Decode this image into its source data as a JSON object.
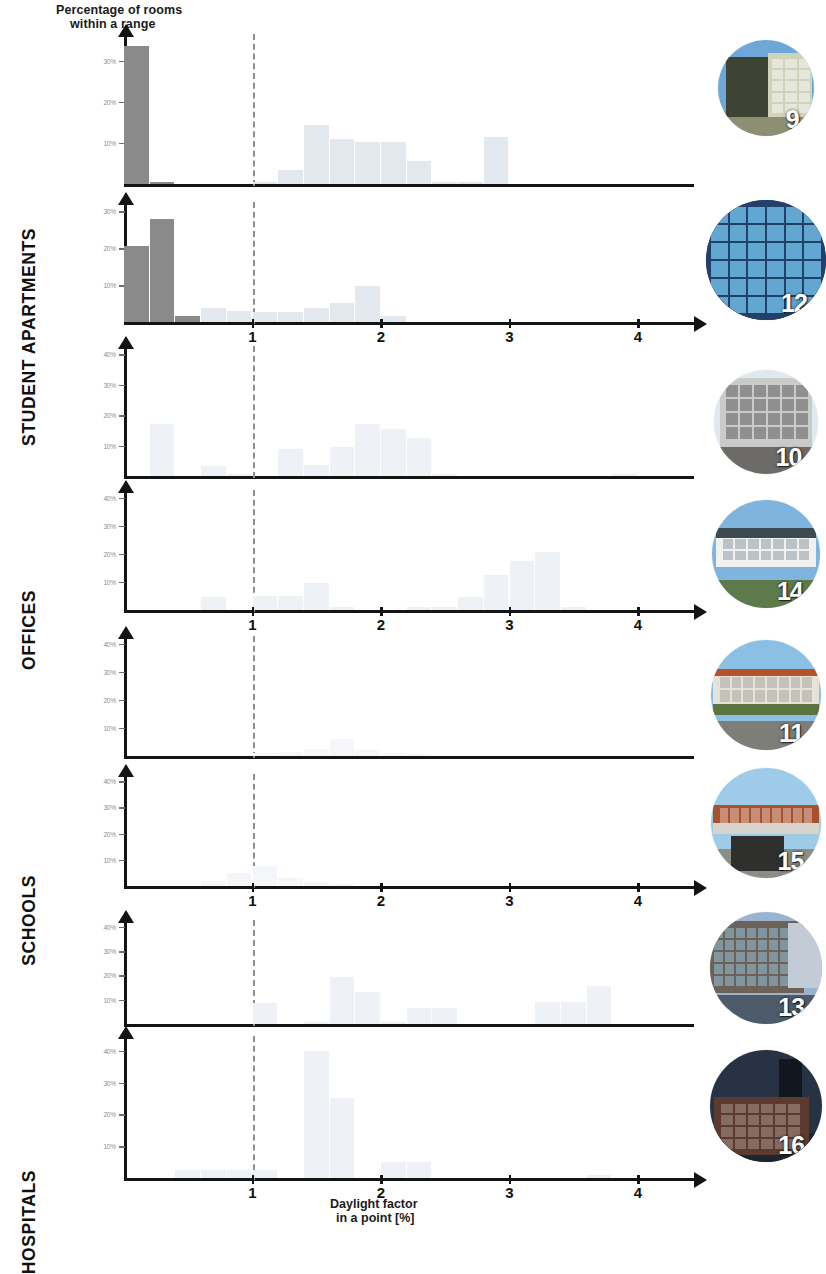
{
  "axis_titles": {
    "y_line1": "Percentage of rooms",
    "y_line2": "within a range",
    "x_line1": "Daylight factor",
    "x_line2": "in a point [%]"
  },
  "categories": [
    {
      "label": "STUDENT APARTMENTS"
    },
    {
      "label": "OFFICES"
    },
    {
      "label": "SCHOOLS"
    },
    {
      "label": "HOSPITALS"
    }
  ],
  "photos": [
    {
      "number": "9",
      "caption": "student-apartment-building"
    },
    {
      "number": "12",
      "caption": "student-apartment-facade"
    },
    {
      "number": "10",
      "caption": "office-corner-building"
    },
    {
      "number": "14",
      "caption": "office-modern-building"
    },
    {
      "number": "11",
      "caption": "school-low-rise-building"
    },
    {
      "number": "15",
      "caption": "school-yard-with-bicycle"
    },
    {
      "number": "13",
      "caption": "hospital-glass-facade"
    },
    {
      "number": "16",
      "caption": "hospital-brick-building"
    }
  ],
  "reference_line": {
    "value": 1,
    "style": "dashed",
    "color": "#8d8d95"
  },
  "chart_data": [
    {
      "type": "bar",
      "id": "student-apartments-9",
      "category": "STUDENT APARTMENTS",
      "photo_number": "9",
      "title": "",
      "xlabel": "Daylight factor in a point [%]",
      "ylabel": "Percentage of rooms within a range",
      "xlim": [
        0,
        4.6
      ],
      "ylim": [
        0,
        36
      ],
      "xticks": [
        1,
        2,
        3,
        4
      ],
      "xtick_labels": [
        "1",
        "2",
        "3",
        "4"
      ],
      "yticks": [
        10,
        20,
        30
      ],
      "ytick_labels": [
        "10%",
        "20%",
        "30%"
      ],
      "bin_width": 0.2,
      "bins": [
        0.0,
        0.2,
        0.4,
        0.6,
        0.8,
        1.0,
        1.2,
        1.4,
        1.6,
        1.8,
        2.0,
        2.2,
        2.4,
        2.6,
        2.8,
        3.0,
        3.2,
        3.4,
        3.6,
        3.8,
        4.0,
        4.2,
        4.4
      ],
      "values": [
        33.5,
        0.4,
        0,
        0,
        0,
        0.4,
        3.4,
        14.3,
        11.0,
        10.3,
        10.3,
        5.6,
        0.4,
        0.4,
        11.4,
        0,
        0,
        0,
        0,
        0,
        0,
        0,
        0
      ]
    },
    {
      "type": "bar",
      "id": "student-apartments-12",
      "category": "STUDENT APARTMENTS",
      "photo_number": "12",
      "title": "",
      "xlabel": "Daylight factor in a point [%]",
      "ylabel": "Percentage of rooms within a range",
      "xlim": [
        0,
        4.6
      ],
      "ylim": [
        0,
        32
      ],
      "xticks": [
        1,
        2,
        3,
        4
      ],
      "xtick_labels": [
        "1",
        "2",
        "3",
        "4"
      ],
      "yticks": [
        10,
        20,
        30
      ],
      "ytick_labels": [
        "10%",
        "20%",
        "30%"
      ],
      "bin_width": 0.2,
      "bins": [
        0.0,
        0.2,
        0.4,
        0.6,
        0.8,
        1.0,
        1.2,
        1.4,
        1.6,
        1.8,
        2.0,
        2.2,
        2.4,
        2.6,
        2.8,
        3.0,
        3.2,
        3.4,
        3.6,
        3.8,
        4.0,
        4.2,
        4.4
      ],
      "values": [
        20.5,
        28.0,
        1.7,
        3.7,
        3.0,
        2.6,
        2.6,
        3.7,
        5.2,
        9.7,
        1.5,
        0,
        0,
        0,
        0,
        0,
        0,
        0,
        0,
        0,
        0,
        0,
        0
      ]
    },
    {
      "type": "bar",
      "id": "offices-10",
      "category": "OFFICES",
      "photo_number": "10",
      "title": "",
      "xlabel": "Daylight factor in a point [%]",
      "ylabel": "Percentage of rooms within a range",
      "xlim": [
        0,
        4.6
      ],
      "ylim": [
        0,
        42
      ],
      "xticks": [
        1,
        2,
        3,
        4
      ],
      "xtick_labels": [
        "1",
        "2",
        "3",
        "4"
      ],
      "yticks": [
        10,
        20,
        30,
        40
      ],
      "ytick_labels": [
        "10%",
        "20%",
        "30%",
        "40%"
      ],
      "bin_width": 0.2,
      "bins": [
        0.0,
        0.2,
        0.4,
        0.6,
        0.8,
        1.0,
        1.2,
        1.4,
        1.6,
        1.8,
        2.0,
        2.2,
        2.4,
        2.6,
        2.8,
        3.0,
        3.2,
        3.4,
        3.6,
        3.8,
        4.0,
        4.2,
        4.4
      ],
      "values": [
        0,
        17.0,
        0,
        3.3,
        0.6,
        0,
        9.0,
        3.5,
        9.5,
        17.0,
        15.5,
        12.5,
        0.8,
        0,
        0,
        0,
        0,
        0,
        0,
        0.6,
        0,
        0,
        0
      ]
    },
    {
      "type": "bar",
      "id": "offices-14",
      "category": "OFFICES",
      "photo_number": "14",
      "title": "",
      "xlabel": "Daylight factor in a point [%]",
      "ylabel": "Percentage of rooms within a range",
      "xlim": [
        0,
        4.6
      ],
      "ylim": [
        0,
        42
      ],
      "xticks": [
        1,
        2,
        3,
        4
      ],
      "xtick_labels": [
        "1",
        "2",
        "3",
        "4"
      ],
      "yticks": [
        10,
        20,
        30,
        40
      ],
      "ytick_labels": [
        "10%",
        "20%",
        "30%",
        "40%"
      ],
      "bin_width": 0.2,
      "bins": [
        0.0,
        0.2,
        0.4,
        0.6,
        0.8,
        1.0,
        1.2,
        1.4,
        1.6,
        1.8,
        2.0,
        2.2,
        2.4,
        2.6,
        2.8,
        3.0,
        3.2,
        3.4,
        3.6,
        3.8,
        4.0,
        4.2,
        4.4
      ],
      "values": [
        0,
        0,
        0,
        4.5,
        0,
        5.0,
        5.0,
        9.5,
        1.2,
        0,
        0,
        1.0,
        1.0,
        4.8,
        12.5,
        17.5,
        20.5,
        1.0,
        0,
        0,
        0,
        0,
        0
      ]
    },
    {
      "type": "bar",
      "id": "schools-11",
      "category": "SCHOOLS",
      "photo_number": "11",
      "title": "",
      "xlabel": "Daylight factor in a point [%]",
      "ylabel": "Percentage of rooms within a range",
      "xlim": [
        0,
        4.6
      ],
      "ylim": [
        0,
        42
      ],
      "xticks": [
        1,
        2,
        3,
        4
      ],
      "xtick_labels": [
        "1",
        "2",
        "3",
        "4"
      ],
      "yticks": [
        10,
        20,
        30,
        40
      ],
      "ytick_labels": [
        "10%",
        "20%",
        "30%",
        "40%"
      ],
      "bin_width": 0.2,
      "bins": [
        0.0,
        0.2,
        0.4,
        0.6,
        0.8,
        1.0,
        1.2,
        1.4,
        1.6,
        1.8,
        2.0,
        2.2,
        2.4,
        2.6,
        2.8,
        3.0,
        3.2,
        3.4,
        3.6,
        3.8,
        4.0,
        4.2,
        4.4
      ],
      "values": [
        0,
        0,
        0,
        0,
        0,
        1.0,
        1.5,
        2.5,
        6.0,
        2.0,
        1.0,
        0.6,
        0,
        0,
        0,
        0,
        0,
        0,
        0,
        0,
        0,
        0,
        0
      ]
    },
    {
      "type": "bar",
      "id": "schools-15",
      "category": "SCHOOLS",
      "photo_number": "15",
      "title": "",
      "xlabel": "Daylight factor in a point [%]",
      "ylabel": "Percentage of rooms within a range",
      "xlim": [
        0,
        4.6
      ],
      "ylim": [
        0,
        42
      ],
      "xticks": [
        1,
        2,
        3,
        4
      ],
      "xtick_labels": [
        "1",
        "2",
        "3",
        "4"
      ],
      "yticks": [
        10,
        20,
        30,
        40
      ],
      "ytick_labels": [
        "10%",
        "20%",
        "30%",
        "40%"
      ],
      "bin_width": 0.2,
      "bins": [
        0.0,
        0.2,
        0.4,
        0.6,
        0.8,
        1.0,
        1.2,
        1.4,
        1.6,
        1.8,
        2.0,
        2.2,
        2.4,
        2.6,
        2.8,
        3.0,
        3.2,
        3.4,
        3.6,
        3.8,
        4.0,
        4.2,
        4.4
      ],
      "values": [
        0,
        0,
        0,
        2.0,
        5.0,
        7.5,
        3.0,
        1.5,
        0.8,
        0,
        0,
        0,
        0,
        0,
        0,
        0,
        0,
        0,
        0,
        0,
        0,
        0,
        0
      ]
    },
    {
      "type": "bar",
      "id": "hospitals-13",
      "category": "HOSPITALS",
      "photo_number": "13",
      "title": "",
      "xlabel": "Daylight factor in a point [%]",
      "ylabel": "Percentage of rooms within a range",
      "xlim": [
        0,
        4.6
      ],
      "ylim": [
        0,
        42
      ],
      "xticks": [
        1,
        2,
        3,
        4
      ],
      "xtick_labels": [
        "1",
        "2",
        "3",
        "4"
      ],
      "yticks": [
        10,
        20,
        30,
        40
      ],
      "ytick_labels": [
        "10%",
        "20%",
        "30%",
        "40%"
      ],
      "bin_width": 0.2,
      "bins": [
        0.0,
        0.2,
        0.4,
        0.6,
        0.8,
        1.0,
        1.2,
        1.4,
        1.6,
        1.8,
        2.0,
        2.2,
        2.4,
        2.6,
        2.8,
        3.0,
        3.2,
        3.4,
        3.6,
        3.8,
        4.0,
        4.2,
        4.4
      ],
      "values": [
        0,
        0,
        0,
        0,
        0,
        8.5,
        0,
        1.0,
        19.5,
        13.0,
        0.8,
        6.5,
        6.5,
        0,
        0,
        0,
        9.0,
        9.0,
        15.5,
        0,
        0,
        0,
        0
      ]
    },
    {
      "type": "bar",
      "id": "hospitals-16",
      "category": "HOSPITALS",
      "photo_number": "16",
      "title": "",
      "xlabel": "Daylight factor in a point [%]",
      "ylabel": "Percentage of rooms within a range",
      "xlim": [
        0,
        4.6
      ],
      "ylim": [
        0,
        44
      ],
      "xticks": [
        1,
        2,
        3,
        4
      ],
      "xtick_labels": [
        "1",
        "2",
        "3",
        "4"
      ],
      "yticks": [
        10,
        20,
        30,
        40
      ],
      "ytick_labels": [
        "10%",
        "20%",
        "30%",
        "40%"
      ],
      "bin_width": 0.2,
      "bins": [
        0.0,
        0.2,
        0.4,
        0.6,
        0.8,
        1.0,
        1.2,
        1.4,
        1.6,
        1.8,
        2.0,
        2.2,
        2.4,
        2.6,
        2.8,
        3.0,
        3.2,
        3.4,
        3.6,
        3.8,
        4.0,
        4.2,
        4.4
      ],
      "values": [
        0,
        0,
        2.5,
        2.5,
        2.5,
        2.5,
        0,
        40.0,
        25.0,
        0,
        5.0,
        5.0,
        0,
        0,
        0,
        0,
        0,
        0,
        0.8,
        0,
        0,
        0,
        0
      ]
    }
  ]
}
